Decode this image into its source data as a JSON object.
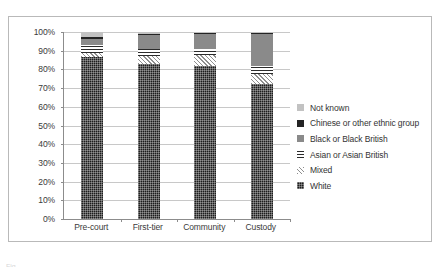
{
  "chart_data": {
    "type": "bar",
    "stacked": true,
    "stack_mode": "percent",
    "title": "",
    "xlabel": "",
    "ylabel": "",
    "ylim": [
      0,
      100
    ],
    "ytick_labels": [
      "100%",
      "90%",
      "80%",
      "70%",
      "60%",
      "50%",
      "40%",
      "30%",
      "20%",
      "10%",
      "0%"
    ],
    "ytick_values": [
      100,
      90,
      80,
      70,
      60,
      50,
      40,
      30,
      20,
      10,
      0
    ],
    "grid": true,
    "legend_position": "right",
    "categories": [
      "Pre-court",
      "First-tier",
      "Community",
      "Custody"
    ],
    "series": [
      {
        "name": "White",
        "values": [
          86.5,
          83.0,
          82.0,
          72.0
        ],
        "color": "#1d1d1d",
        "pattern": "dense-dot"
      },
      {
        "name": "Mixed",
        "values": [
          2.5,
          4.0,
          5.5,
          5.5
        ],
        "color": "#f2f2f2",
        "pattern": "diagonal-hatch"
      },
      {
        "name": "Asian or Asian British",
        "values": [
          4.0,
          4.0,
          3.5,
          4.5
        ],
        "color": "#ffffff",
        "pattern": "grid-hatch"
      },
      {
        "name": "Black or Black British",
        "values": [
          3.5,
          7.5,
          8.0,
          17.0
        ],
        "color": "#8a8a8a",
        "pattern": "solid"
      },
      {
        "name": "Chinese or other ethnic group",
        "values": [
          1.0,
          0.5,
          0.5,
          0.5
        ],
        "color": "#242424",
        "pattern": "solid"
      },
      {
        "name": "Not known",
        "values": [
          2.5,
          1.0,
          0.5,
          0.5
        ],
        "color": "#c2c2c2",
        "pattern": "solid"
      }
    ],
    "legend_entries": [
      "Not known",
      "Chinese or other ethnic group",
      "Black or Black British",
      "Asian or Asian British",
      "Mixed",
      "White"
    ]
  },
  "caption": {
    "text": "Fig"
  }
}
